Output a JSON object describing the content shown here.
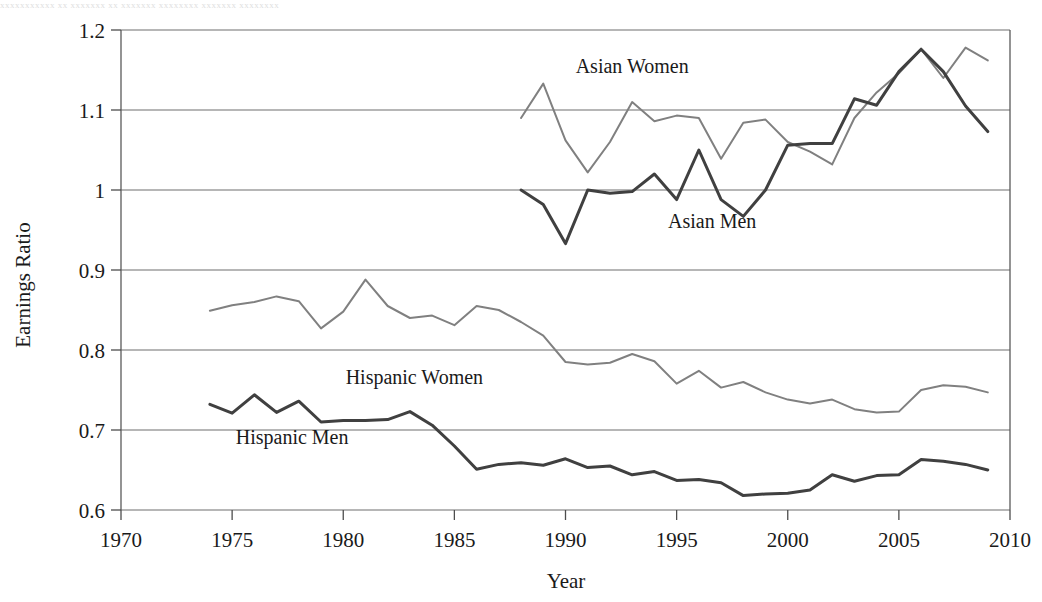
{
  "top_cropped_text": "xxxxxxxxxxx xx xxxxxxx xx xxxxxxx xxxxxxxx xxxxxxx xxxxxxxx",
  "chart_data": {
    "type": "line",
    "title": "",
    "xlabel": "Year",
    "ylabel": "Earnings Ratio",
    "xlim": [
      1970,
      2010
    ],
    "ylim": [
      0.6,
      1.2
    ],
    "xticks": [
      1970,
      1975,
      1980,
      1985,
      1990,
      1995,
      2000,
      2005,
      2010
    ],
    "xtick_labels": [
      "1970",
      "1975",
      "1980",
      "1985",
      "1990",
      "1995",
      "2000",
      "2005",
      "2010"
    ],
    "yticks": [
      0.6,
      0.7,
      0.8,
      0.9,
      1.0,
      1.1,
      1.2
    ],
    "ytick_labels": [
      "0.6",
      "0.7",
      "0.8",
      "0.9",
      "1",
      "1.1",
      "1.2"
    ],
    "grid": true,
    "legend": "inline-annotations",
    "series": [
      {
        "name": "Asian Women",
        "color": "#808080",
        "width": 2.0,
        "label_x": 1993.0,
        "label_y": 1.146,
        "x": [
          1988,
          1989,
          1990,
          1991,
          1992,
          1993,
          1994,
          1995,
          1996,
          1997,
          1998,
          1999,
          2000,
          2001,
          2002,
          2003,
          2004,
          2005,
          2006,
          2007,
          2008,
          2009
        ],
        "values": [
          1.09,
          1.133,
          1.062,
          1.022,
          1.06,
          1.11,
          1.086,
          1.093,
          1.09,
          1.039,
          1.084,
          1.088,
          1.06,
          1.048,
          1.032,
          1.09,
          1.122,
          1.146,
          1.176,
          1.14,
          1.178,
          1.162
        ]
      },
      {
        "name": "Asian Men",
        "color": "#404040",
        "width": 3.0,
        "label_x": 1996.6,
        "label_y": 0.952,
        "x": [
          1988,
          1989,
          1990,
          1991,
          1992,
          1993,
          1994,
          1995,
          1996,
          1997,
          1998,
          1999,
          2000,
          2001,
          2002,
          2003,
          2004,
          2005,
          2006,
          2007,
          2008,
          2009
        ],
        "values": [
          1.0,
          0.982,
          0.933,
          1.0,
          0.996,
          0.998,
          1.02,
          0.988,
          1.05,
          0.988,
          0.967,
          1.0,
          1.056,
          1.058,
          1.058,
          1.114,
          1.106,
          1.148,
          1.176,
          1.148,
          1.105,
          1.073
        ]
      },
      {
        "name": "Hispanic Women",
        "color": "#808080",
        "width": 2.0,
        "label_x": 1983.2,
        "label_y": 0.757,
        "x": [
          1974,
          1975,
          1976,
          1977,
          1978,
          1979,
          1980,
          1981,
          1982,
          1983,
          1984,
          1985,
          1986,
          1987,
          1988,
          1989,
          1990,
          1991,
          1992,
          1993,
          1994,
          1995,
          1996,
          1997,
          1998,
          1999,
          2000,
          2001,
          2002,
          2003,
          2004,
          2005,
          2006,
          2007,
          2008,
          2009
        ],
        "values": [
          0.849,
          0.856,
          0.86,
          0.867,
          0.861,
          0.827,
          0.848,
          0.888,
          0.855,
          0.84,
          0.843,
          0.831,
          0.855,
          0.85,
          0.835,
          0.818,
          0.785,
          0.782,
          0.784,
          0.795,
          0.786,
          0.758,
          0.774,
          0.753,
          0.76,
          0.747,
          0.738,
          0.733,
          0.738,
          0.726,
          0.722,
          0.723,
          0.75,
          0.756,
          0.754,
          0.747
        ]
      },
      {
        "name": "Hispanic Men",
        "color": "#404040",
        "width": 3.0,
        "label_x": 1977.7,
        "label_y": 0.683,
        "x": [
          1974,
          1975,
          1976,
          1977,
          1978,
          1979,
          1980,
          1981,
          1982,
          1983,
          1984,
          1985,
          1986,
          1987,
          1988,
          1989,
          1990,
          1991,
          1992,
          1993,
          1994,
          1995,
          1996,
          1997,
          1998,
          1999,
          2000,
          2001,
          2002,
          2003,
          2004,
          2005,
          2006,
          2007,
          2008,
          2009
        ],
        "values": [
          0.732,
          0.721,
          0.744,
          0.722,
          0.736,
          0.71,
          0.712,
          0.712,
          0.713,
          0.723,
          0.706,
          0.68,
          0.651,
          0.657,
          0.659,
          0.656,
          0.664,
          0.653,
          0.655,
          0.644,
          0.648,
          0.637,
          0.638,
          0.634,
          0.618,
          0.62,
          0.621,
          0.625,
          0.644,
          0.636,
          0.643,
          0.644,
          0.663,
          0.661,
          0.657,
          0.65
        ]
      }
    ]
  }
}
